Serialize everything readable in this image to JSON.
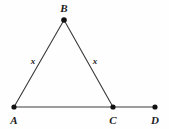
{
  "figure": {
    "background_color": "#fefefe",
    "stroke_color": "#3a3a3a",
    "point_color": "#111111",
    "label_color": "#1b1b1b"
  },
  "points": {
    "A": {
      "label": "A",
      "x": 14,
      "y": 107,
      "label_x": 14,
      "label_y": 120
    },
    "B": {
      "label": "B",
      "x": 64,
      "y": 20,
      "label_x": 64,
      "label_y": 8
    },
    "C": {
      "label": "C",
      "x": 113,
      "y": 107,
      "label_x": 113,
      "label_y": 120
    },
    "D": {
      "label": "D",
      "x": 155,
      "y": 107,
      "label_x": 155,
      "label_y": 120
    }
  },
  "segments": [
    {
      "name": "AB",
      "from": "A",
      "to": "B"
    },
    {
      "name": "BC",
      "from": "B",
      "to": "C"
    },
    {
      "name": "AD",
      "from": "A",
      "to": "D"
    }
  ],
  "side_labels": {
    "left": {
      "text": "x",
      "x": 33,
      "y": 61
    },
    "right": {
      "text": "x",
      "x": 95,
      "y": 61
    }
  }
}
